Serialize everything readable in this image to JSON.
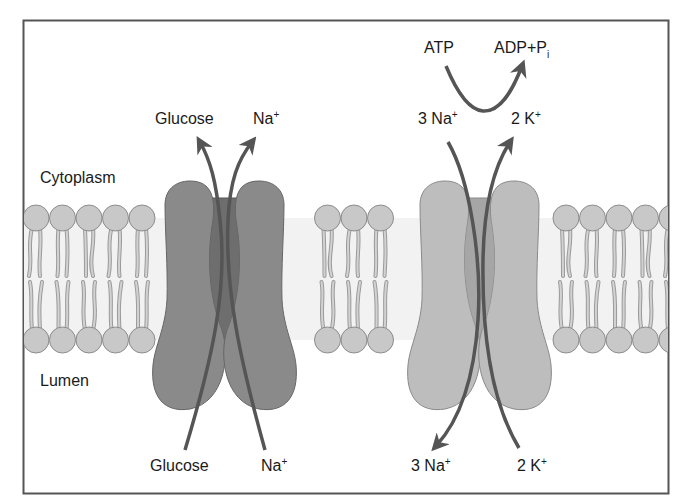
{
  "diagram": {
    "compartments": {
      "top": "Cytoplasm",
      "bottom": "Lumen"
    },
    "symporter": {
      "name": "Na+/glucose symporter",
      "top_labels": {
        "glucose": "Glucose",
        "sodium": "Na",
        "sodium_charge": "+"
      },
      "bottom_labels": {
        "glucose": "Glucose",
        "sodium": "Na",
        "sodium_charge": "+"
      },
      "direction": "lumen to cytoplasm (both)"
    },
    "pump": {
      "name": "Na+/K+ ATPase",
      "energy": {
        "atp": "ATP",
        "products": "ADP+P",
        "products_subscript": "i"
      },
      "top_labels": {
        "sodium": "3 Na",
        "sodium_charge": "+",
        "potassium": "2 K",
        "potassium_charge": "+"
      },
      "bottom_labels": {
        "sodium": "3 Na",
        "sodium_charge": "+",
        "potassium": "2 K",
        "potassium_charge": "+"
      },
      "direction": "3 Na+ cytoplasm to lumen; 2 K+ lumen to cytoplasm"
    },
    "colors": {
      "border": "#555555",
      "membrane_bg": "#f2f2f2",
      "lipid_head": "#c8c8c8",
      "lipid_outline": "#8c8c8c",
      "symporter_fill": "#8a8a8a",
      "symporter_channel": "#6e6e6e",
      "pump_fill": "#bdbdbd",
      "pump_channel": "#a6a6a6",
      "arrow": "#555555"
    }
  }
}
